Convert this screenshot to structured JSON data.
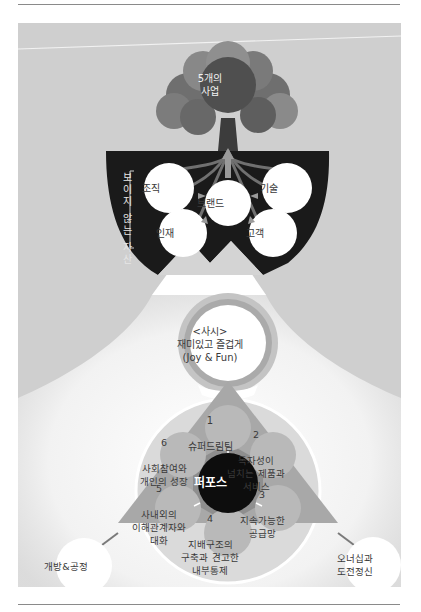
{
  "diagram": {
    "tree": {
      "crown_label": "5개의\n사업"
    },
    "invisible_assets": {
      "section_label": "보이지 않는 자산",
      "center": "브랜드",
      "items": [
        "조직",
        "기술",
        "인재",
        "고객"
      ]
    },
    "ethos": {
      "label": "<사시>\n재미있고 즐겁게\n(Joy & Fun)"
    },
    "purpose": {
      "center": "퍼포스",
      "petals": [
        {
          "number": "1",
          "text": "슈퍼드림팀"
        },
        {
          "number": "2",
          "text": "독자성이\n넘치는 제품과\n서비스"
        },
        {
          "number": "3",
          "text": "지속가능한\n공급망"
        },
        {
          "number": "4",
          "text": "지배구조의\n구축과 견고한\n내부통제"
        },
        {
          "number": "5",
          "text": "사내외의\n이해관계자와\n대화"
        },
        {
          "number": "6",
          "text": "사회참여와\n개인의 성장"
        }
      ],
      "values": [
        "개방&공정",
        "오너십과\n도전정신"
      ]
    },
    "colors": {
      "panel_bg": "#cfcfcf",
      "soil": "#1a1a1a",
      "tree_dark": "#5a5a5a",
      "tree_mid": "#7a7a7a",
      "tree_light": "#9a9a9a",
      "triangle": "#a8a8a8",
      "petal": "#b8b8b8",
      "hexagon": "#8e8e8e",
      "ring_outer": "#c4c4c4",
      "ring_inner": "#a9a9a9",
      "core": "#0d0d0d"
    }
  }
}
